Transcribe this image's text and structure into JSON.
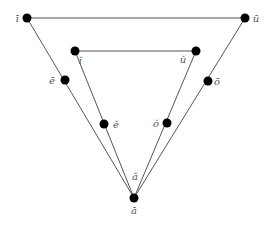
{
  "diagram": {
    "title": "",
    "line_color": "#555555",
    "node_color": "#000000",
    "nodes": [
      {
        "id": "i_long",
        "label": "ī"
      },
      {
        "id": "u_long",
        "label": "ū"
      },
      {
        "id": "i_short",
        "label": "ĭ"
      },
      {
        "id": "u_short",
        "label": "ŭ"
      },
      {
        "id": "e_long",
        "label": "ē"
      },
      {
        "id": "o_long",
        "label": "ō"
      },
      {
        "id": "e_short",
        "label": "ĕ"
      },
      {
        "id": "o_short",
        "label": "ŏ"
      },
      {
        "id": "a_short",
        "label": "ă"
      },
      {
        "id": "a_long",
        "label": "ā"
      }
    ],
    "edges": [
      [
        "i_long",
        "u_long"
      ],
      [
        "i_short",
        "u_short"
      ],
      [
        "i_long",
        "a_long"
      ],
      [
        "u_long",
        "a_long"
      ],
      [
        "i_short",
        "a_long"
      ],
      [
        "u_short",
        "a_long"
      ]
    ]
  }
}
